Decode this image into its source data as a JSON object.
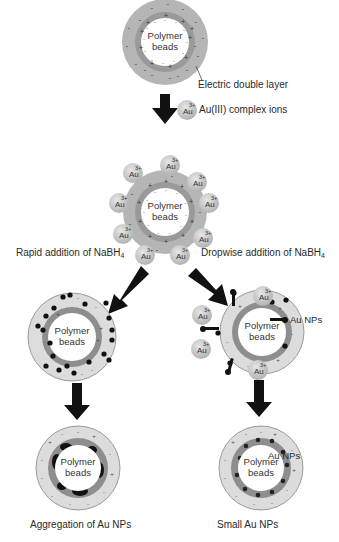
{
  "diagram": {
    "type": "process-flow",
    "stages": [
      {
        "id": "stage-1",
        "label": "Polymer beads",
        "annotation": "Electric double layer"
      },
      {
        "id": "stage-2",
        "label": "Polymer beads",
        "added": "Au(III) complex ions"
      },
      {
        "id": "stage-3a",
        "label": "Polymer beads",
        "via": "Rapid addition of NaBH4"
      },
      {
        "id": "stage-3b",
        "label": "Polymer beads",
        "via": "Dropwise addition of NaBH4",
        "annotation": "Au NPs"
      },
      {
        "id": "stage-4a",
        "label": "Polymer beads",
        "result": "Aggregation of Au NPs"
      },
      {
        "id": "stage-4b",
        "label": "Polymer beads",
        "result": "Small Au NPs",
        "annotation": "Au NPs"
      }
    ]
  },
  "labels": {
    "bead_line1": "Polymer",
    "bead_line2": "beads",
    "electric_double_layer": "Electric double layer",
    "au_ion_symbol": "Au",
    "au_ion_charge": "3+",
    "au_complex_ions": "Au(III) complex ions",
    "rapid_prefix": "Rapid addition of NaBH",
    "dropwise_prefix": "Dropwise addition of NaBH",
    "subscript_4": "4",
    "au_nps": "Au NPs",
    "aggregation": "Aggregation of Au NPs",
    "small_nps": "Small Au NPs"
  },
  "colors": {
    "outer_layer": "#b8b8b8",
    "outer_layer_light": "#d8d8d8",
    "inner_ring": "#8a8a8a",
    "bead": "#ffffff",
    "nanoparticle": "#111111",
    "arrow": "#111111",
    "au_ion": "#c9c9c9"
  }
}
